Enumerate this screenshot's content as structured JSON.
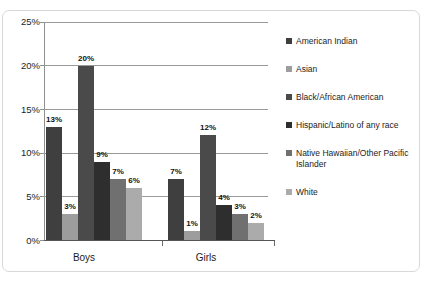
{
  "chart_data": {
    "type": "bar",
    "title": "",
    "xlabel": "",
    "ylabel": "",
    "categories": [
      "Boys",
      "Girls"
    ],
    "ylim": [
      0,
      25
    ],
    "ytick_labels": [
      "0%",
      "5%",
      "10%",
      "15%",
      "20%",
      "25%"
    ],
    "ytick_values": [
      0,
      5,
      10,
      15,
      20,
      25
    ],
    "grid": true,
    "legend_position": "right",
    "value_suffix": "%",
    "series": [
      {
        "name": "American Indian",
        "color": "#3f3f3f",
        "values": [
          13,
          7
        ],
        "labels": [
          "13%",
          "7%"
        ]
      },
      {
        "name": "Asian",
        "color": "#9d9d9d",
        "values": [
          3,
          1
        ],
        "labels": [
          "3%",
          "1%"
        ]
      },
      {
        "name": "Black/African American",
        "color": "#4a4a4a",
        "values": [
          20,
          12
        ],
        "labels": [
          "20%",
          "12%"
        ]
      },
      {
        "name": "Hispanic/Latino of any race",
        "color": "#2e2e2e",
        "values": [
          9,
          4
        ],
        "labels": [
          "9%",
          "4%"
        ]
      },
      {
        "name": "Native Hawaiian/Other Pacific Islander",
        "color": "#707070",
        "values": [
          7,
          3
        ],
        "labels": [
          "7%",
          "3%"
        ]
      },
      {
        "name": "White",
        "color": "#ababab",
        "values": [
          6,
          2
        ],
        "labels": [
          "6%",
          "2%"
        ]
      }
    ]
  },
  "axis": {
    "tick_0": "0%",
    "tick_1": "5%",
    "tick_2": "10%",
    "tick_3": "15%",
    "tick_4": "20%",
    "tick_5": "25%"
  },
  "groups": {
    "boys": "Boys",
    "girls": "Girls"
  },
  "legend": {
    "item_0": "American Indian",
    "item_1": "Asian",
    "item_2": "Black/African American",
    "item_3": "Hispanic/Latino of any race",
    "item_4": "Native Hawaiian/Other Pacific Islander",
    "item_5": "White"
  },
  "bar_labels": {
    "boys_0": "13%",
    "boys_1": "3%",
    "boys_2": "20%",
    "boys_3": "9%",
    "boys_4": "7%",
    "boys_5": "6%",
    "girls_0": "7%",
    "girls_1": "1%",
    "girls_2": "12%",
    "girls_3": "4%",
    "girls_4": "3%",
    "girls_5": "2%"
  }
}
